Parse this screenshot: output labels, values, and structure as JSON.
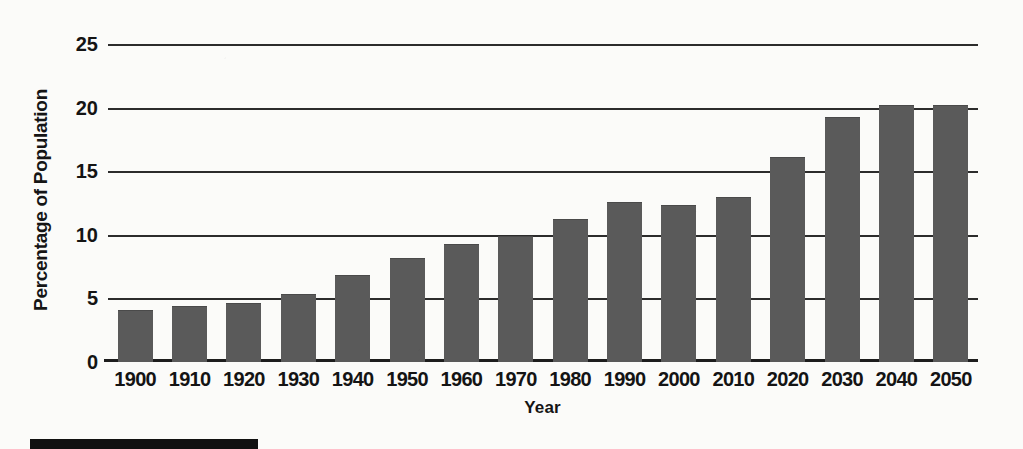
{
  "chart_data": {
    "type": "bar",
    "title": "",
    "xlabel": "Year",
    "ylabel": "Percentage of Population",
    "categories": [
      "1900",
      "1910",
      "1920",
      "1930",
      "1940",
      "1950",
      "1960",
      "1970",
      "1980",
      "1990",
      "2000",
      "2010",
      "2020",
      "2030",
      "2040",
      "2050"
    ],
    "values": [
      4.0,
      4.3,
      4.6,
      5.3,
      6.8,
      8.1,
      9.2,
      9.8,
      11.2,
      12.5,
      12.3,
      12.9,
      16.0,
      19.2,
      20.1,
      20.1
    ],
    "ylim": [
      0,
      25
    ],
    "yticks": [
      "0",
      "5",
      "10",
      "15",
      "20",
      "25"
    ],
    "ytick_values": [
      0,
      5,
      10,
      15,
      20,
      25
    ],
    "grid": "horizontal",
    "legend": "none",
    "series": [
      {
        "name": "Percentage of Population",
        "values": [
          4.0,
          4.3,
          4.6,
          5.3,
          6.8,
          8.1,
          9.2,
          9.8,
          11.2,
          12.5,
          12.3,
          12.9,
          16.0,
          19.2,
          20.1,
          20.1
        ]
      }
    ]
  },
  "colors": {
    "bar_fill": "#5a5a5a",
    "gridline": "#2c2c2c",
    "axis": "#1d1d1d",
    "text": "#141414",
    "page_background": "#fbfbf9",
    "artifact_black": "#111111"
  },
  "artifact": {
    "black_bar_label": ""
  }
}
